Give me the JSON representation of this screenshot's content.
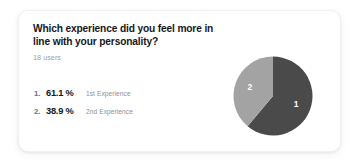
{
  "card": {
    "question": "Which experience did you feel more in line with your personality?",
    "respondents": "18 users"
  },
  "results": [
    {
      "rank": "1.",
      "percent": "61.1 %",
      "label": "1st Experience",
      "slice_label": "1"
    },
    {
      "rank": "2.",
      "percent": "38.9 %",
      "label": "2nd Experience",
      "slice_label": "2"
    }
  ],
  "colors": {
    "slice_1": "#4a4a4a",
    "slice_2": "#a3a3a3",
    "title": "#16181c",
    "muted": "#9aa0a6",
    "card_bg": "#ffffff"
  },
  "chart_data": {
    "type": "pie",
    "title": "Which experience did you feel more in line with your personality?",
    "categories": [
      "1st Experience",
      "2nd Experience"
    ],
    "values": [
      61.1,
      38.9
    ],
    "value_unit": "%",
    "slice_labels": [
      "1",
      "2"
    ],
    "colors": [
      "#4a4a4a",
      "#a3a3a3"
    ],
    "total_respondents": 18,
    "start_angle_deg": 0,
    "direction": "clockwise",
    "legend": "none",
    "grid": false,
    "annotations": [
      "1",
      "2"
    ]
  }
}
